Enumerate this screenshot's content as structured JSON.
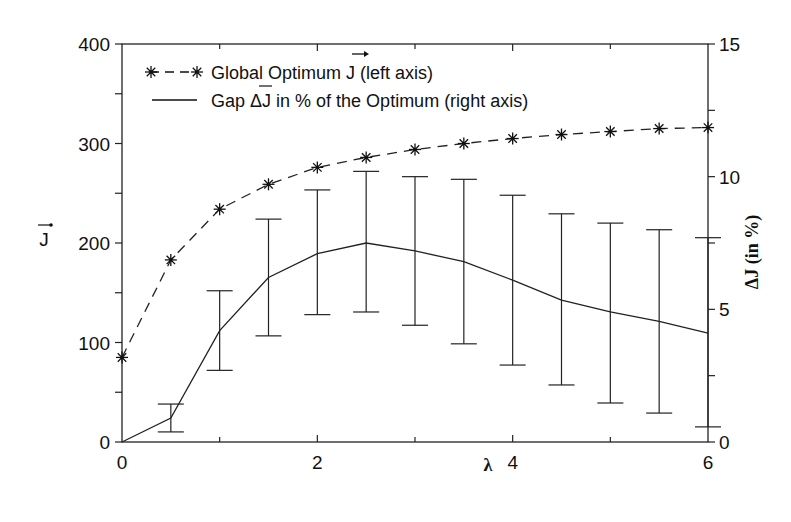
{
  "chart_data": {
    "type": "line",
    "title": "",
    "xlabel": "λ",
    "ylabel_left": "J⃗",
    "ylabel_right": "ΔJ (in %)",
    "xlim": [
      0,
      6
    ],
    "ylim_left": [
      0,
      400
    ],
    "ylim_right": [
      0,
      15
    ],
    "x_ticks": [
      0,
      2,
      4,
      6
    ],
    "x_tick_labels": [
      "0",
      "2",
      "4",
      "6"
    ],
    "y_left_ticks": [
      0,
      100,
      200,
      300,
      400
    ],
    "y_left_tick_labels": [
      "0",
      "100",
      "200",
      "300",
      "400"
    ],
    "y_right_ticks": [
      0,
      5,
      10,
      15
    ],
    "y_right_tick_labels": [
      "0",
      "5",
      "10",
      "15"
    ],
    "grid": false,
    "legend_position": "upper left",
    "x": [
      0,
      0.5,
      1,
      1.5,
      2,
      2.5,
      3,
      3.5,
      4,
      4.5,
      5,
      5.5,
      6
    ],
    "series": [
      {
        "name": "Global Optimum J⃗ (left axis)",
        "axis": "left",
        "style": "dashed",
        "marker": "asterisk",
        "values": [
          85,
          183,
          234,
          259,
          276,
          286,
          294,
          300,
          305,
          309,
          312,
          315,
          316
        ]
      },
      {
        "name": "Gap ΔJ in % of the Optimum (right axis)",
        "axis": "right",
        "style": "solid",
        "marker": "none",
        "values": [
          0,
          0.9,
          4.2,
          6.2,
          7.1,
          7.5,
          7.2,
          6.8,
          6.1,
          5.35,
          4.9,
          4.55,
          4.1
        ],
        "error_low": [
          0,
          0.38,
          2.7,
          4.0,
          4.8,
          4.9,
          4.4,
          3.7,
          2.9,
          2.15,
          1.47,
          1.09,
          0.57
        ],
        "error_high": [
          0,
          1.43,
          5.7,
          8.4,
          9.5,
          10.2,
          10.0,
          9.9,
          9.3,
          8.6,
          8.25,
          8.0,
          7.7
        ]
      }
    ]
  },
  "legend": {
    "item1_prefix": "Global Optimum J",
    "item1_suffix": " (left axis)",
    "item2_prefix": "Gap ",
    "item2_mid": "ΔJ",
    "item2_suffix": " in % of the Optimum (right axis)"
  },
  "axes": {
    "xlabel": "λ",
    "ylabel_left": "J",
    "ylabel_right": "ΔJ (in %)"
  }
}
